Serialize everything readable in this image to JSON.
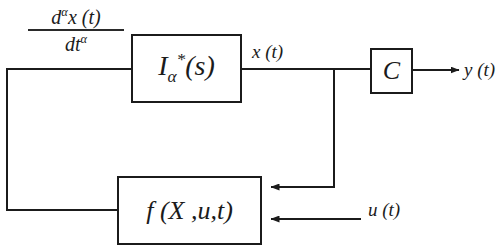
{
  "diagram": {
    "canvas": {
      "width": 502,
      "height": 252,
      "background": "#ffffff"
    },
    "stroke_color": "#1b1b1b",
    "blocks": [
      {
        "id": "integrator",
        "label_plain": "I*a(s)",
        "label_main": "I",
        "label_sub": "α",
        "label_sup": "*",
        "label_tail": "(s)",
        "x": 131,
        "y": 34,
        "w": 111,
        "h": 69
      },
      {
        "id": "gain-c",
        "label_plain": "C",
        "x": 370,
        "y": 48,
        "w": 43,
        "h": 46
      },
      {
        "id": "feedback-f",
        "label_plain": "f (X ,u,t)",
        "x": 117,
        "y": 176,
        "w": 145,
        "h": 69
      }
    ],
    "fraction": {
      "numerator_main": "d",
      "numerator_sup": "α",
      "numerator_tail": "x (t)",
      "denominator_main": "dt",
      "denominator_sup": "α",
      "plain": "d^α x(t) / dt^α"
    },
    "signals": [
      {
        "id": "x-of-t",
        "label": "x (t)"
      },
      {
        "id": "y-of-t",
        "label": "y (t)"
      },
      {
        "id": "u-of-t",
        "label": "u (t)"
      }
    ],
    "wires": [
      {
        "id": "deriv-to-integrator",
        "from": "left-feedback-top",
        "to": "integrator-input"
      },
      {
        "id": "integrator-to-node",
        "from": "integrator-output",
        "to": "x-node"
      },
      {
        "id": "node-to-gain",
        "from": "x-node",
        "to": "gain-c-input"
      },
      {
        "id": "gain-to-output",
        "from": "gain-c-output",
        "to": "y-of-t",
        "arrow": true
      },
      {
        "id": "node-down-to-f",
        "from": "x-node",
        "to": "feedback-f-input-top",
        "arrow": true
      },
      {
        "id": "u-into-f",
        "from": "u-of-t",
        "to": "feedback-f-input-bottom",
        "arrow": true
      },
      {
        "id": "f-out-left-loop",
        "from": "feedback-f-output",
        "to": "integrator-input"
      }
    ]
  }
}
